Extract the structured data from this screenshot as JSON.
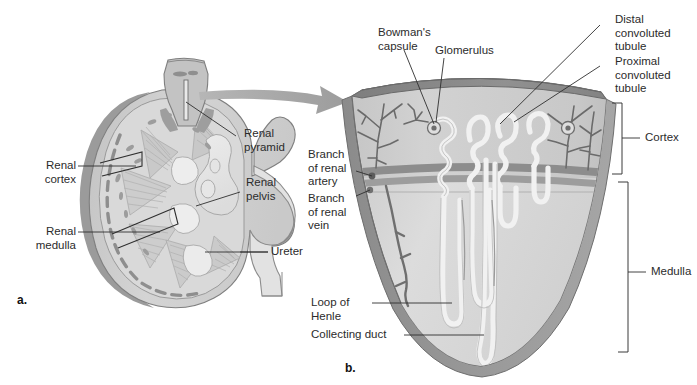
{
  "figure": {
    "background_color": "#ffffff",
    "width": 697,
    "height": 385
  },
  "panels": [
    {
      "id": "a",
      "label": "a.",
      "caption": "Kidney cross-section"
    },
    {
      "id": "b",
      "label": "b.",
      "caption": "Nephron wedge detail"
    }
  ],
  "panel_a": {
    "id_label": "a.",
    "labels": [
      {
        "key": "renal_pyramid",
        "text": "Renal\npyramid"
      },
      {
        "key": "renal_cortex",
        "text": "Renal\ncortex"
      },
      {
        "key": "renal_pelvis",
        "text": "Renal\npelvis"
      },
      {
        "key": "renal_medulla",
        "text": "Renal\nmedulla"
      },
      {
        "key": "ureter",
        "text": "Ureter"
      }
    ]
  },
  "panel_b": {
    "id_label": "b.",
    "labels": [
      {
        "key": "bowmans_capsule",
        "text": "Bowman's\ncapsule"
      },
      {
        "key": "glomerulus",
        "text": "Glomerulus"
      },
      {
        "key": "distal_convoluted_tubule",
        "text": "Distal\nconvoluted\ntubule"
      },
      {
        "key": "proximal_convoluted_tubule",
        "text": "Proximal\nconvoluted\ntubule"
      },
      {
        "key": "cortex",
        "text": "Cortex"
      },
      {
        "key": "medulla",
        "text": "Medulla"
      },
      {
        "key": "branch_of_renal_artery",
        "text": "Branch\nof renal\nartery"
      },
      {
        "key": "branch_of_renal_vein",
        "text": "Branch\nof renal\nvein"
      },
      {
        "key": "loop_of_henle",
        "text": "Loop of\nHenle"
      },
      {
        "key": "collecting_duct",
        "text": "Collecting duct"
      }
    ]
  },
  "colors": {
    "background": "#ffffff",
    "capsule_outer": "#9a9a9a",
    "capsule_mid": "#b4b4b4",
    "cortex_fill": "#cfcfcf",
    "medulla_fill": "#d9d9d9",
    "pelvis_fill": "#e6e6e6",
    "pyramid_fill": "#c6c6c6",
    "tubule_light": "#eeeeee",
    "vessel_dark": "#7d7d7d",
    "band_dark": "#8e8e8e",
    "arrow_gray": "#a0a0a0",
    "leader_line": "#3a3a3a",
    "text": "#2b2b2b",
    "top_face": "#8a8a8a"
  },
  "graphic_elements": {
    "transition_arrow": "curved-arrow-right",
    "bracket_cortex": "right-bracket",
    "bracket_medulla": "right-bracket"
  }
}
